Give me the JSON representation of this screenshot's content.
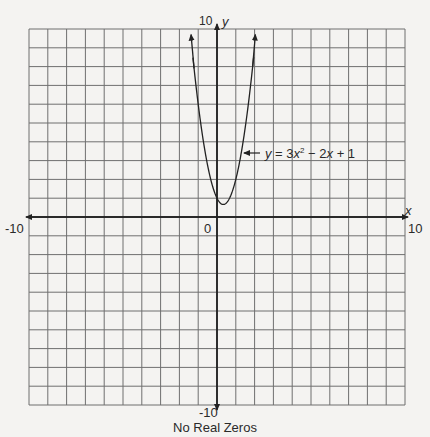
{
  "chart_data": {
    "type": "line",
    "title": "",
    "caption": "No Real Zeros",
    "xlabel": "x",
    "ylabel": "y",
    "xlim": [
      -10,
      10
    ],
    "ylim": [
      -10,
      10
    ],
    "grid": true,
    "grid_step": 1,
    "tick_labels": {
      "x_min": "-10",
      "x_max": "10",
      "y_min": "-10",
      "y_max": "10",
      "origin": "0"
    },
    "series": [
      {
        "name": "y = 3x² − 2x + 1",
        "equation": "y = 3x^2 - 2x + 1",
        "coefficients": {
          "a": 3,
          "b": -2,
          "c": 1
        },
        "vertex": [
          0.333,
          0.667
        ],
        "x": [
          -1.5,
          -1.25,
          -1,
          -0.75,
          -0.5,
          -0.25,
          0,
          0.333,
          0.5,
          0.75,
          1,
          1.25,
          1.5,
          1.8,
          2.15
        ],
        "values": [
          10.75,
          8.19,
          6,
          4.19,
          2.75,
          1.69,
          1,
          0.667,
          0.75,
          1.19,
          2,
          3.19,
          4.75,
          7.12,
          10.57
        ]
      }
    ],
    "annotations": [
      {
        "text": "y = 3x² − 2x + 1",
        "arrow_to": [
          1.35,
          3.5
        ]
      }
    ],
    "real_zeros": []
  },
  "labels": {
    "y_axis_name": "y",
    "x_axis_name": "x",
    "y_max": "10",
    "y_min": "-10",
    "x_min": "-10",
    "x_max": "10",
    "origin": "0",
    "caption": "No Real Zeros",
    "eq_y": "y",
    "eq_rest_1": " = 3",
    "eq_x1": "x",
    "eq_sup": "2",
    "eq_rest_2": " − 2",
    "eq_x2": "x",
    "eq_rest_3": " + 1"
  }
}
